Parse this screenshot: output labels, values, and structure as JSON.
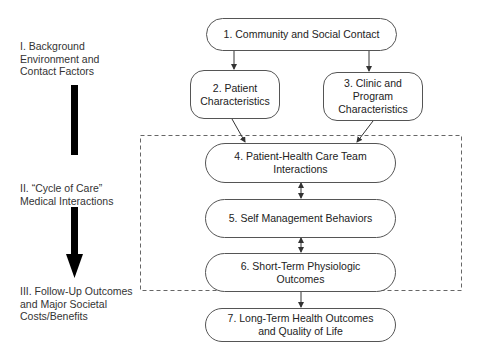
{
  "diagram": {
    "stages": [
      {
        "label": "I. Background\nEnvironment and\nContact Factors"
      },
      {
        "label": "II. “Cycle of Care”\nMedical Interactions"
      },
      {
        "label": "III. Follow-Up Outcomes\nand Major Societal\nCosts/Benefits"
      }
    ],
    "nodes": [
      {
        "id": 1,
        "label": "1. Community and Social Contact"
      },
      {
        "id": 2,
        "label": "2. Patient\nCharacteristics"
      },
      {
        "id": 3,
        "label": "3. Clinic and Program\nCharacteristics"
      },
      {
        "id": 4,
        "label": "4. Patient-Health Care Team\nInteractions"
      },
      {
        "id": 5,
        "label": "5. Self Management Behaviors"
      },
      {
        "id": 6,
        "label": "6. Short-Term Physiologic\nOutcomes"
      },
      {
        "id": 7,
        "label": "7. Long-Term Health Outcomes\nand Quality of Life"
      }
    ],
    "edges": [
      {
        "from": 1,
        "to": 2,
        "type": "directed"
      },
      {
        "from": 1,
        "to": 3,
        "type": "directed"
      },
      {
        "from": 2,
        "to": 4,
        "type": "directed"
      },
      {
        "from": 3,
        "to": 4,
        "type": "directed"
      },
      {
        "from": 4,
        "to": 5,
        "type": "bidirectional"
      },
      {
        "from": 5,
        "to": 6,
        "type": "bidirectional"
      },
      {
        "from": 6,
        "to": 7,
        "type": "directed"
      }
    ],
    "group": {
      "name": "cycle-of-care-boundary",
      "style": "dashed",
      "contains": [
        4,
        5,
        6
      ]
    }
  }
}
